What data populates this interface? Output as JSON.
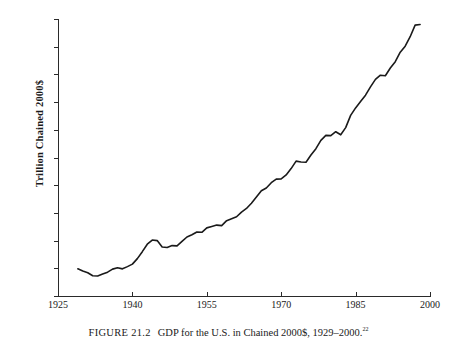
{
  "figure": {
    "caption_number": "FIGURE 21.2",
    "caption_text": "GDP for the U.S. in Chained 2000$, 1929–2000.",
    "footnote_marker": "22"
  },
  "chart_data": {
    "type": "line",
    "title": "GDP for the U.S. in Chained 2000$, 1929–2000.",
    "xlabel": "",
    "ylabel": "Trillion Chained 2000$",
    "xlim": [
      1925,
      2000
    ],
    "ylim": [
      0,
      10
    ],
    "grid": false,
    "legend": null,
    "line_color": "#1a1a1a",
    "x_ticks": [
      1925,
      1940,
      1955,
      1970,
      1985,
      2000
    ],
    "x_tick_labels": [
      "1925",
      "1940",
      "1955",
      "1970",
      "1985",
      "2000"
    ],
    "y_ticks": [
      0,
      1,
      2,
      3,
      4,
      5,
      6,
      7,
      8,
      9,
      10
    ],
    "y_tick_labels": [
      "0",
      "1",
      "2",
      "3",
      "4",
      "5",
      "6",
      "7",
      "8",
      "9",
      "10"
    ],
    "series": [
      {
        "name": "Real GDP",
        "x": [
          1929,
          1930,
          1931,
          1932,
          1933,
          1934,
          1935,
          1936,
          1937,
          1938,
          1939,
          1940,
          1941,
          1942,
          1943,
          1944,
          1945,
          1946,
          1947,
          1948,
          1949,
          1950,
          1951,
          1952,
          1953,
          1954,
          1955,
          1956,
          1957,
          1958,
          1959,
          1960,
          1961,
          1962,
          1963,
          1964,
          1965,
          1966,
          1967,
          1968,
          1969,
          1970,
          1971,
          1972,
          1973,
          1974,
          1975,
          1976,
          1977,
          1978,
          1979,
          1980,
          1981,
          1982,
          1983,
          1984,
          1985,
          1986,
          1987,
          1988,
          1989,
          1990,
          1991,
          1992,
          1993,
          1994,
          1995,
          1996,
          1997,
          1998,
          1999,
          2000
        ],
        "y": [
          0.98,
          0.9,
          0.84,
          0.73,
          0.72,
          0.79,
          0.86,
          0.97,
          1.02,
          0.98,
          1.06,
          1.15,
          1.35,
          1.6,
          1.87,
          2.02,
          2.0,
          1.77,
          1.75,
          1.82,
          1.81,
          1.97,
          2.13,
          2.21,
          2.31,
          2.3,
          2.46,
          2.51,
          2.56,
          2.54,
          2.72,
          2.79,
          2.86,
          3.03,
          3.16,
          3.35,
          3.57,
          3.8,
          3.9,
          4.09,
          4.22,
          4.23,
          4.37,
          4.6,
          4.87,
          4.84,
          4.83,
          5.09,
          5.32,
          5.62,
          5.8,
          5.79,
          5.93,
          5.82,
          6.08,
          6.52,
          6.79,
          7.02,
          7.25,
          7.55,
          7.82,
          7.97,
          7.95,
          8.23,
          8.46,
          8.8,
          9.02,
          9.36,
          9.78,
          10.19,
          10.64,
          11.0
        ],
        "y_displayed_start": 0.98,
        "y_displayed_end": 9.8,
        "notes": [
          "Great Depression trough near 1933",
          "World War II peak near 1944",
          "Post-war contraction 1945-1947",
          "1958 recession dip",
          "1974-1975 plateau",
          "1980-1982 double-dip recession",
          "1990-1991 recession flat spot"
        ]
      }
    ]
  }
}
